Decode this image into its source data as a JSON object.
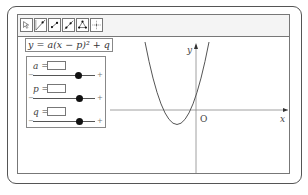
{
  "toolbar": {
    "tools": [
      {
        "name": "move-tool",
        "icon": "pointer-icon"
      },
      {
        "name": "line-tool",
        "icon": "line-icon"
      },
      {
        "name": "segment-tool",
        "icon": "segment-icon"
      },
      {
        "name": "ray-tool",
        "icon": "ray-icon"
      },
      {
        "name": "polygon-tool",
        "icon": "polygon-icon"
      },
      {
        "name": "move-view-tool",
        "icon": "move-view-icon"
      }
    ]
  },
  "formula": {
    "text": "y = a(x − p)² + q"
  },
  "parameters": [
    {
      "label": "a =",
      "value": "",
      "min_label": "−",
      "max_label": "+",
      "slider_position": 0.72
    },
    {
      "label": "p =",
      "value": "",
      "min_label": "−",
      "max_label": "+",
      "slider_position": 0.74
    },
    {
      "label": "q =",
      "value": "",
      "min_label": "−",
      "max_label": "+",
      "slider_position": 0.74
    }
  ],
  "graph": {
    "x_axis_label": "x",
    "y_axis_label": "y",
    "origin_label": "O",
    "curve": "parabola opening upward, vertex below x-axis and left of y-axis",
    "colors": {
      "axis": "#888888",
      "curve": "#555555"
    }
  }
}
